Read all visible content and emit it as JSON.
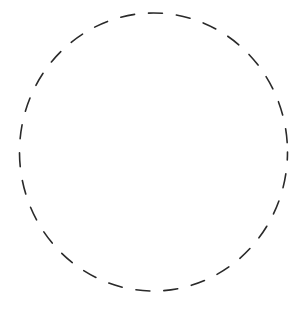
{
  "canvas": {
    "width": 303,
    "height": 314,
    "background": "#ffffff"
  },
  "shape": {
    "type": "dashed-ellipse",
    "cx": 153.5,
    "cy": 152,
    "rx": 134,
    "ry": 139,
    "stroke": "#2a2a2a",
    "stroke_width": 1.6,
    "dasharray": "14 14",
    "dashoffset": "6"
  }
}
